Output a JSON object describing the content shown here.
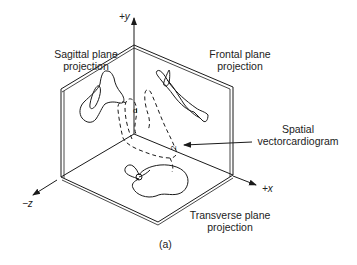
{
  "figure": {
    "caption": "(a)",
    "labels": {
      "sagittal_line1": "Sagittal plane",
      "sagittal_line2": "projection",
      "frontal_line1": "Frontal plane",
      "frontal_line2": "projection",
      "spatial_line1": "Spatial",
      "spatial_line2": "vectorcardiogram",
      "transverse_line1": "Transverse plane",
      "transverse_line2": "projection"
    },
    "axes": {
      "y": "+y",
      "x": "+x",
      "z": "−z"
    },
    "colors": {
      "ink": "#1a1a1a",
      "background": "#ffffff"
    }
  }
}
